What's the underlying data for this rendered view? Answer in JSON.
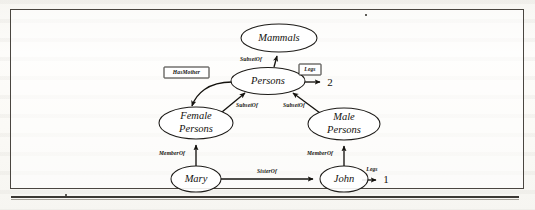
{
  "figure": {
    "kind": "semantic-network-diagram",
    "frame": {
      "x": 10,
      "y": 9,
      "width": 514,
      "height": 180
    },
    "nodes": [
      {
        "id": "mammals",
        "label": "Mammals",
        "lines": [
          "Mammals"
        ],
        "cx": 279,
        "cy": 38,
        "rx": 38,
        "ry": 14
      },
      {
        "id": "persons",
        "label": "Persons",
        "lines": [
          "Persons"
        ],
        "cx": 268,
        "cy": 81,
        "rx": 37,
        "ry": 13.5
      },
      {
        "id": "female-persons",
        "label": "Female Persons",
        "lines": [
          "Female",
          "Persons"
        ],
        "cx": 196,
        "cy": 123,
        "rx": 37,
        "ry": 16
      },
      {
        "id": "male-persons",
        "label": "Male Persons",
        "lines": [
          "Male",
          "Persons"
        ],
        "cx": 344,
        "cy": 124,
        "rx": 36,
        "ry": 16
      },
      {
        "id": "mary",
        "label": "Mary",
        "lines": [
          "Mary"
        ],
        "cx": 196,
        "cy": 179,
        "rx": 25,
        "ry": 13
      },
      {
        "id": "john",
        "label": "John",
        "lines": [
          "John"
        ],
        "cx": 344,
        "cy": 179,
        "rx": 24,
        "ry": 13
      }
    ],
    "edges": [
      {
        "id": "persons-subsetof-mammals",
        "label": "SubsetOf",
        "from": "persons",
        "to": "mammals",
        "boxed": false
      },
      {
        "id": "female-subsetof-persons",
        "label": "SubsetOf",
        "from": "female-persons",
        "to": "persons",
        "boxed": false
      },
      {
        "id": "male-subsetof-persons",
        "label": "SubsetOf",
        "from": "male-persons",
        "to": "persons",
        "boxed": false
      },
      {
        "id": "persons-hasmother-female",
        "label": "HasMother",
        "from": "persons",
        "to": "female-persons",
        "boxed": true
      },
      {
        "id": "persons-legs-2",
        "label": "Legs",
        "from": "persons",
        "to": "value-2",
        "boxed": true
      },
      {
        "id": "mary-memberof-female",
        "label": "MemberOf",
        "from": "mary",
        "to": "female-persons",
        "boxed": false
      },
      {
        "id": "john-memberof-male",
        "label": "MemberOf",
        "from": "john",
        "to": "male-persons",
        "boxed": false
      },
      {
        "id": "mary-sisterof-john",
        "label": "SisterOf",
        "from": "mary",
        "to": "john",
        "boxed": false
      },
      {
        "id": "john-legs-1",
        "label": "Legs",
        "from": "john",
        "to": "value-1",
        "boxed": false
      }
    ],
    "values": [
      {
        "id": "value-2",
        "label": "2",
        "x": 330,
        "y": 83
      },
      {
        "id": "value-1",
        "label": "1",
        "x": 386,
        "y": 180
      }
    ],
    "colors": {
      "ink": "#15130f",
      "frame": "#4a4640",
      "paper": "#fbfaf7",
      "node_fill": "#ffffff"
    }
  }
}
